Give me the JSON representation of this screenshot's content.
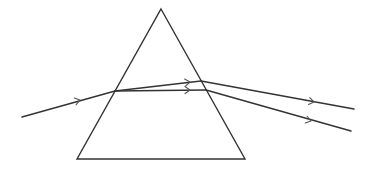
{
  "diagram": {
    "type": "prism-dispersion",
    "colors": {
      "stroke": "#333333",
      "arrow": "#555555",
      "background": "#ffffff"
    },
    "prism": {
      "apex": [
        161,
        9
      ],
      "base_left": [
        77,
        159
      ],
      "base_right": [
        245,
        159
      ]
    },
    "incident_ray": {
      "from": [
        22,
        117
      ],
      "to": [
        115,
        91
      ],
      "arrow_at": [
        80,
        100
      ]
    },
    "internal_rays": [
      {
        "name": "upper",
        "from": [
          115,
          91
        ],
        "to": [
          201,
          81
        ],
        "arrow_at": [
          190,
          82
        ]
      },
      {
        "name": "lower",
        "from": [
          115,
          91
        ],
        "to": [
          206,
          90
        ],
        "arrow_at": [
          190,
          90
        ]
      }
    ],
    "emergent_rays": [
      {
        "name": "upper",
        "from": [
          201,
          81
        ],
        "to": [
          354,
          109
        ],
        "arrow_at": [
          314,
          102
        ]
      },
      {
        "name": "lower",
        "from": [
          206,
          90
        ],
        "to": [
          351,
          131
        ],
        "arrow_at": [
          311,
          121
        ]
      }
    ]
  }
}
